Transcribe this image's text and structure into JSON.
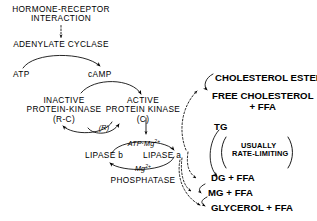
{
  "diagram": {
    "background": "#ffffff",
    "ink": "#000000",
    "width": 317,
    "height": 221
  },
  "nodes": {
    "hormone_receptor_line1": "HORMONE-RECEPTOR",
    "hormone_receptor_line2": "INTERACTION",
    "adenylate_cyclase": "ADENYLATE CYCLASE",
    "atp": "ATP",
    "camp": "cAMP",
    "inactive_kinase_line1": "INACTIVE",
    "inactive_kinase_line2": "PROTEIN-KINASE",
    "inactive_kinase_line3": "(R-C)",
    "active_kinase_line1": "ACTIVE",
    "active_kinase_line2": "PROTEIN KINASE",
    "active_kinase_line3": "(C)",
    "r_subunit": "(R)",
    "atp_mg": "ATP·Mg",
    "atp_mg_charge": "2+",
    "mg": "Mg",
    "mg_charge": "2+",
    "lipase_b": "LIPASE b",
    "lipase_a": "LIPASE a",
    "phosphatase": "PHOSPHATASE",
    "cholesterol_ester": "CHOLESTEROL ESTER",
    "free_cholesterol_line1": "FREE CHOLESTEROL",
    "free_cholesterol_line2": "+ FFA",
    "tg": "TG",
    "rate_limiting_line1": "USUALLY",
    "rate_limiting_line2": "RATE-LIMITING",
    "dg_ffa": "DG + FFA",
    "mg_ffa": "MG + FFA",
    "glycerol_ffa": "GLYCEROL + FFA"
  }
}
